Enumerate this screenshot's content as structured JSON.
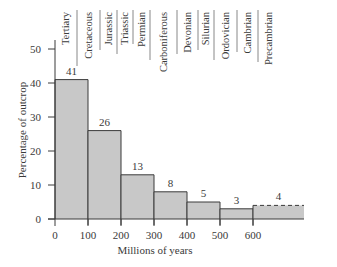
{
  "chart_data": {
    "type": "bar",
    "subtype": "histogram",
    "title": "",
    "xlabel": "Millions of years",
    "ylabel": "Percentage of outcrop",
    "xlim": [
      0,
      750
    ],
    "ylim": [
      0,
      55
    ],
    "x_ticks": [
      0,
      100,
      200,
      300,
      400,
      500,
      600
    ],
    "y_ticks": [
      0,
      10,
      20,
      30,
      40,
      50
    ],
    "grid": false,
    "legend": null,
    "bins": [
      {
        "start": 0,
        "end": 100,
        "value": 41,
        "label": "41"
      },
      {
        "start": 100,
        "end": 200,
        "value": 26,
        "label": "26"
      },
      {
        "start": 200,
        "end": 300,
        "value": 13,
        "label": "13"
      },
      {
        "start": 300,
        "end": 400,
        "value": 8,
        "label": "8"
      },
      {
        "start": 400,
        "end": 500,
        "value": 5,
        "label": "5"
      },
      {
        "start": 500,
        "end": 600,
        "value": 3,
        "label": "3"
      },
      {
        "start": 600,
        "end": 750,
        "value": 4,
        "label": "4",
        "dashed_top": true
      }
    ],
    "categories": [
      "0-100",
      "100-200",
      "200-300",
      "300-400",
      "400-500",
      "500-600",
      "600+"
    ],
    "values": [
      41,
      26,
      13,
      8,
      5,
      3,
      4
    ],
    "annotations": {
      "geologic_periods": [
        {
          "name": "Tertiary",
          "start": 0,
          "end": 66
        },
        {
          "name": "Cretaceous",
          "start": 66,
          "end": 138
        },
        {
          "name": "Jurassic",
          "start": 138,
          "end": 190
        },
        {
          "name": "Triassic",
          "start": 190,
          "end": 238
        },
        {
          "name": "Permian",
          "start": 238,
          "end": 290
        },
        {
          "name": "Carboniferous",
          "start": 290,
          "end": 370
        },
        {
          "name": "Devonian",
          "start": 370,
          "end": 435
        },
        {
          "name": "Silurian",
          "start": 435,
          "end": 485
        },
        {
          "name": "Ordovician",
          "start": 485,
          "end": 555
        },
        {
          "name": "Cambrian",
          "start": 555,
          "end": 617
        },
        {
          "name": "Precambrian",
          "start": 617,
          "end": 700
        }
      ]
    },
    "colors": {
      "bar_fill": "#c8c8c8",
      "bar_stroke": "#3a3a3a",
      "axis": "#3a3a3a",
      "text": "#3a3a3a"
    }
  }
}
